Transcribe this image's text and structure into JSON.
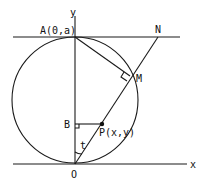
{
  "diagram": {
    "type": "geometry",
    "labels": {
      "y_axis": "y",
      "x_axis": "x",
      "A": "A(0,a)",
      "N": "N",
      "M": "M",
      "B": "B",
      "P": "P(x,y)",
      "O": "O",
      "t": "t"
    },
    "points": {
      "A": [
        75,
        37
      ],
      "N": [
        158,
        37
      ],
      "M": [
        130,
        76
      ],
      "B": [
        75,
        124
      ],
      "P": [
        102,
        124
      ],
      "O": [
        75,
        163
      ]
    },
    "circle": {
      "cx": 75,
      "cy": 100,
      "r": 63
    },
    "stroke_color": "#1a1a1a"
  }
}
